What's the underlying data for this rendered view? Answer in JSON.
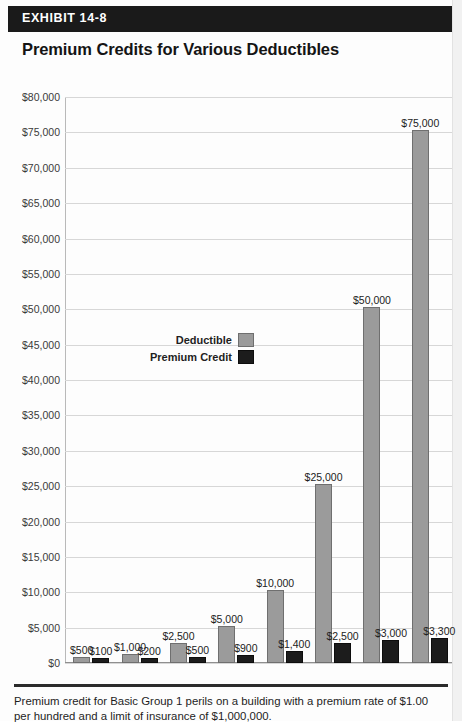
{
  "header": {
    "exhibit_label": "EXHIBIT 14-8",
    "title": "Premium Credits for Various Deductibles"
  },
  "legend": {
    "deductible_label": "Deductible",
    "premium_credit_label": "Premium Credit"
  },
  "footnote": {
    "line1": "Premium credit for Basic Group 1 perils on a building with a premium rate of $1.00 per",
    "line2": "hundred and a limit of insurance of $1,000,000."
  },
  "colors": {
    "deductible_bar": "#9b9b9b",
    "premium_bar": "#1c1c1c",
    "header_bar": "#1a1a1a",
    "grid": "#d7d7d7"
  },
  "chart_data": {
    "type": "bar",
    "title": "Premium Credits for Various Deductibles",
    "xlabel": "",
    "ylabel": "",
    "ylim": [
      0,
      80000
    ],
    "ytick_step": 5000,
    "grid": true,
    "legend_position": "center-left",
    "ytick_labels": [
      "$80,000",
      "$75,000",
      "$70,000",
      "$65,000",
      "$60,000",
      "$55,000",
      "$50,000",
      "$45,000",
      "$40,000",
      "$35,000",
      "$30,000",
      "$25,000",
      "$20,000",
      "$15,000",
      "$10,000",
      "$5,000",
      "$0"
    ],
    "ytick_values": [
      80000,
      75000,
      70000,
      65000,
      60000,
      55000,
      50000,
      45000,
      40000,
      35000,
      30000,
      25000,
      20000,
      15000,
      10000,
      5000,
      0
    ],
    "categories": [
      "$500",
      "$1,000",
      "$2,500",
      "$5,000",
      "$10,000",
      "$25,000",
      "$50,000",
      "$75,000"
    ],
    "series": [
      {
        "name": "Deductible",
        "values": [
          500,
          1000,
          2500,
          5000,
          10000,
          25000,
          50000,
          75000
        ],
        "labels": [
          "$500",
          "$1,000",
          "$2,500",
          "$5,000",
          "$10,000",
          "$25,000",
          "$50,000",
          "$75,000"
        ],
        "color": "#9b9b9b"
      },
      {
        "name": "Premium Credit",
        "values": [
          100,
          200,
          500,
          900,
          1400,
          2500,
          3000,
          3300
        ],
        "labels": [
          "$100",
          "$200",
          "$500",
          "$900",
          "$1,400",
          "$2,500",
          "$3,000",
          "$3,300"
        ],
        "color": "#1c1c1c"
      }
    ]
  }
}
